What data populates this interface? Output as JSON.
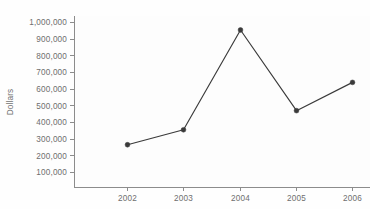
{
  "chart_data": {
    "type": "line",
    "title": "",
    "subtitle": "",
    "xlabel": "",
    "ylabel": "Dollars",
    "categories": [
      "2002",
      "2003",
      "2004",
      "2005",
      "2006"
    ],
    "x": [
      2002,
      2003,
      2004,
      2005,
      2006
    ],
    "values": [
      265000,
      355000,
      955000,
      470000,
      640000
    ],
    "series": [
      {
        "name": "Dollars",
        "values": [
          265000,
          355000,
          955000,
          470000,
          640000
        ]
      }
    ],
    "ylim": [
      0,
      1000000
    ],
    "xlim": [
      2001.5,
      2006.5
    ],
    "y_ticks": [
      100000,
      200000,
      300000,
      400000,
      500000,
      600000,
      700000,
      800000,
      900000,
      1000000
    ],
    "y_tick_labels": [
      "100,000",
      "200,000",
      "300,000",
      "400,000",
      "500,000",
      "600,000",
      "700,000",
      "800,000",
      "900,000",
      "1,000,000"
    ],
    "x_tick_labels": [
      "2002",
      "2003",
      "2004",
      "2005",
      "2006"
    ],
    "grid": false,
    "legend": false,
    "legend_position": "none",
    "marker": "circle",
    "line_color": "#3a3a3a",
    "marker_color": "#3a3a3a",
    "axis_color": "#8c8c8c",
    "tick_label_color": "#6e6e6e",
    "plot_background": "#fdfdfd",
    "page_background": "#ffffff"
  }
}
